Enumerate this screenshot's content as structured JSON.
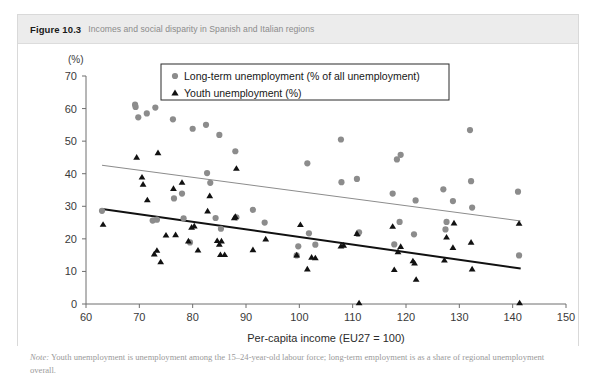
{
  "figure": {
    "label": "Figure 10.3",
    "caption": "Incomes and social disparity in Spanish and Italian regions"
  },
  "note": {
    "prefix": "Note:",
    "text": " Youth unemployment is unemployment among the 15–24-year-old labour force; long-term employment is as a share of regional unemployment overall."
  },
  "legend": {
    "position": "top-center",
    "items": [
      {
        "marker": "circle",
        "color": "#8c8c8c",
        "label": "Long-term unemployment (% of all unemployment)"
      },
      {
        "marker": "triangle",
        "color": "#111111",
        "label": "Youth unemployment (%)"
      }
    ]
  },
  "axes": {
    "y_unit": "(%)",
    "y_ticks": [
      "0",
      "10",
      "20",
      "30",
      "40",
      "50",
      "60",
      "70"
    ],
    "x_ticks": [
      "60",
      "70",
      "80",
      "90",
      "100",
      "110",
      "120",
      "130",
      "140",
      "150"
    ],
    "x_title": "Per-capita income (EU27 = 100)"
  },
  "chart_data": {
    "type": "scatter",
    "title": "Incomes and social disparity in Spanish and Italian regions",
    "xlabel": "Per-capita income (EU27 = 100)",
    "ylabel": "(%)",
    "xlim": [
      60,
      150
    ],
    "ylim": [
      0,
      70
    ],
    "xticks": [
      60,
      70,
      80,
      90,
      100,
      110,
      120,
      130,
      140,
      150
    ],
    "yticks": [
      0,
      10,
      20,
      30,
      40,
      50,
      60,
      70
    ],
    "grid": false,
    "legend_position": "top-center",
    "series": [
      {
        "name": "Long-term unemployment (% of all unemployment)",
        "marker": "circle",
        "color": "#8c8c8c",
        "points": [
          [
            63.0,
            28.6
          ],
          [
            69.2,
            61.2
          ],
          [
            69.3,
            60.5
          ],
          [
            69.8,
            57.3
          ],
          [
            71.4,
            58.5
          ],
          [
            73.0,
            60.3
          ],
          [
            72.5,
            25.6
          ],
          [
            73.3,
            25.9
          ],
          [
            76.3,
            56.7
          ],
          [
            76.5,
            32.4
          ],
          [
            78.0,
            33.9
          ],
          [
            78.3,
            26.3
          ],
          [
            79.5,
            18.9
          ],
          [
            80.0,
            53.8
          ],
          [
            82.5,
            55.0
          ],
          [
            82.7,
            40.2
          ],
          [
            83.3,
            37.2
          ],
          [
            85.0,
            51.9
          ],
          [
            84.3,
            26.4
          ],
          [
            85.3,
            23.1
          ],
          [
            88.0,
            46.9
          ],
          [
            88.2,
            26.6
          ],
          [
            91.3,
            28.9
          ],
          [
            93.5,
            25.0
          ],
          [
            99.5,
            14.9
          ],
          [
            99.8,
            17.7
          ],
          [
            101.5,
            43.2
          ],
          [
            101.8,
            21.7
          ],
          [
            103.0,
            18.2
          ],
          [
            107.8,
            50.5
          ],
          [
            107.9,
            37.4
          ],
          [
            110.8,
            38.4
          ],
          [
            111.0,
            21.5
          ],
          [
            111.2,
            22.0
          ],
          [
            117.5,
            33.9
          ],
          [
            117.8,
            18.3
          ],
          [
            118.3,
            44.4
          ],
          [
            119.0,
            45.8
          ],
          [
            118.8,
            25.2
          ],
          [
            121.8,
            31.8
          ],
          [
            121.5,
            21.4
          ],
          [
            127.0,
            35.2
          ],
          [
            127.4,
            22.9
          ],
          [
            127.6,
            25.2
          ],
          [
            128.8,
            31.6
          ],
          [
            132.0,
            53.4
          ],
          [
            132.2,
            37.7
          ],
          [
            132.4,
            29.6
          ],
          [
            141.0,
            34.5
          ],
          [
            141.2,
            14.9
          ]
        ]
      },
      {
        "name": "Youth unemployment (%)",
        "marker": "triangle",
        "color": "#111111",
        "points": [
          [
            63.2,
            24.4
          ],
          [
            69.5,
            45.0
          ],
          [
            70.5,
            38.9
          ],
          [
            70.7,
            36.7
          ],
          [
            71.5,
            31.9
          ],
          [
            72.8,
            15.3
          ],
          [
            73.3,
            16.4
          ],
          [
            73.5,
            46.4
          ],
          [
            74.0,
            12.9
          ],
          [
            75.0,
            21.1
          ],
          [
            76.4,
            35.4
          ],
          [
            76.8,
            21.2
          ],
          [
            78.0,
            37.3
          ],
          [
            79.2,
            19.3
          ],
          [
            79.8,
            23.5
          ],
          [
            80.3,
            23.9
          ],
          [
            81.0,
            16.5
          ],
          [
            82.8,
            28.5
          ],
          [
            83.2,
            33.2
          ],
          [
            84.6,
            19.4
          ],
          [
            85.0,
            18.3
          ],
          [
            85.4,
            19.3
          ],
          [
            85.2,
            15.1
          ],
          [
            86.0,
            15.1
          ],
          [
            87.8,
            26.4
          ],
          [
            88.0,
            26.8
          ],
          [
            88.2,
            41.6
          ],
          [
            91.3,
            16.6
          ],
          [
            93.7,
            19.9
          ],
          [
            99.5,
            15.0
          ],
          [
            100.2,
            24.3
          ],
          [
            101.5,
            10.7
          ],
          [
            102.3,
            14.3
          ],
          [
            103.0,
            14.1
          ],
          [
            107.8,
            17.7
          ],
          [
            108.3,
            18.0
          ],
          [
            110.8,
            21.6
          ],
          [
            111.2,
            0.3
          ],
          [
            117.5,
            23.8
          ],
          [
            117.8,
            10.5
          ],
          [
            118.5,
            16.0
          ],
          [
            119.0,
            17.6
          ],
          [
            121.3,
            13.2
          ],
          [
            121.6,
            12.5
          ],
          [
            121.9,
            7.5
          ],
          [
            127.2,
            13.4
          ],
          [
            127.6,
            20.5
          ],
          [
            128.8,
            17.3
          ],
          [
            129.0,
            24.8
          ],
          [
            132.2,
            18.9
          ],
          [
            132.4,
            10.7
          ],
          [
            141.2,
            24.7
          ],
          [
            141.3,
            0.3
          ]
        ]
      }
    ],
    "trendlines": [
      {
        "name": "Long-term unemployment trend",
        "color": "#8c8c8c",
        "x": [
          63.0,
          141.5
        ],
        "y": [
          42.6,
          25.5
        ]
      },
      {
        "name": "Youth unemployment trend",
        "color": "#111111",
        "x": [
          63.0,
          141.5
        ],
        "y": [
          29.2,
          10.9
        ]
      }
    ]
  }
}
